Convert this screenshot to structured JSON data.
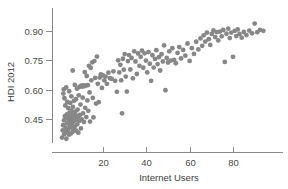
{
  "chart_data": {
    "type": "scatter",
    "title": "",
    "subtitle": "",
    "xlabel": "Internet Users",
    "ylabel": "HDI 2012",
    "xlim": [
      -2,
      100
    ],
    "ylim": [
      0.33,
      0.97
    ],
    "grid": false,
    "legend": null,
    "legend_position": "none",
    "marker": {
      "shape": "circle",
      "color": "#878787",
      "radius_px": 2.4,
      "opacity": 1
    },
    "axis": {
      "line_color": "#8a8a8a",
      "tick_color": "#8a8a8a",
      "label_color": "#4a4a4a"
    },
    "xticks": [
      20,
      40,
      60,
      80
    ],
    "xtick_labels": [
      "20",
      "40",
      "60",
      "80"
    ],
    "yticks": [
      0.45,
      0.6,
      0.75,
      0.9
    ],
    "ytick_labels": [
      "0.45",
      "0.60",
      "0.75",
      "0.90"
    ],
    "n_points": 188,
    "series": [
      {
        "name": "countries",
        "points": [
          [
            1.1,
            0.355
          ],
          [
            1.4,
            0.392
          ],
          [
            1.6,
            0.418
          ],
          [
            1.7,
            0.58
          ],
          [
            1.9,
            0.601
          ],
          [
            2.0,
            0.443
          ],
          [
            2.1,
            0.372
          ],
          [
            2.2,
            0.556
          ],
          [
            2.4,
            0.465
          ],
          [
            2.5,
            0.386
          ],
          [
            2.6,
            0.519
          ],
          [
            2.8,
            0.404
          ],
          [
            2.9,
            0.455
          ],
          [
            3.0,
            0.611
          ],
          [
            3.1,
            0.349
          ],
          [
            3.3,
            0.474
          ],
          [
            3.4,
            0.428
          ],
          [
            3.5,
            0.537
          ],
          [
            3.6,
            0.383
          ],
          [
            3.8,
            0.462
          ],
          [
            3.9,
            0.398
          ],
          [
            4.0,
            0.505
          ],
          [
            4.1,
            0.447
          ],
          [
            4.3,
            0.37
          ],
          [
            4.4,
            0.592
          ],
          [
            4.5,
            0.481
          ],
          [
            4.6,
            0.419
          ],
          [
            4.8,
            0.44
          ],
          [
            4.9,
            0.532
          ],
          [
            5.0,
            0.375
          ],
          [
            5.1,
            0.468
          ],
          [
            5.3,
            0.407
          ],
          [
            5.4,
            0.566
          ],
          [
            5.5,
            0.49
          ],
          [
            5.6,
            0.426
          ],
          [
            5.8,
            0.452
          ],
          [
            5.9,
            0.383
          ],
          [
            6.0,
            0.698
          ],
          [
            6.1,
            0.512
          ],
          [
            6.2,
            0.435
          ],
          [
            6.4,
            0.475
          ],
          [
            6.5,
            0.397
          ],
          [
            6.6,
            0.543
          ],
          [
            6.8,
            0.458
          ],
          [
            6.9,
            0.411
          ],
          [
            7.0,
            0.624
          ],
          [
            7.2,
            0.487
          ],
          [
            7.4,
            0.444
          ],
          [
            7.5,
            0.551
          ],
          [
            7.6,
            0.39
          ],
          [
            7.8,
            0.466
          ],
          [
            8.0,
            0.605
          ],
          [
            8.1,
            0.423
          ],
          [
            8.3,
            0.498
          ],
          [
            8.5,
            0.457
          ],
          [
            8.6,
            0.38
          ],
          [
            8.8,
            0.571
          ],
          [
            9.0,
            0.613
          ],
          [
            9.1,
            0.44
          ],
          [
            9.3,
            0.471
          ],
          [
            9.5,
            0.617
          ],
          [
            9.6,
            0.524
          ],
          [
            9.8,
            0.402
          ],
          [
            10.0,
            0.62
          ],
          [
            10.2,
            0.448
          ],
          [
            10.4,
            0.616
          ],
          [
            10.6,
            0.559
          ],
          [
            10.8,
            0.479
          ],
          [
            11.0,
            0.622
          ],
          [
            11.2,
            0.435
          ],
          [
            11.4,
            0.618
          ],
          [
            11.6,
            0.69
          ],
          [
            11.8,
            0.507
          ],
          [
            12.0,
            0.621
          ],
          [
            12.3,
            0.46
          ],
          [
            12.5,
            0.67
          ],
          [
            12.8,
            0.545
          ],
          [
            13.0,
            0.623
          ],
          [
            13.2,
            0.492
          ],
          [
            13.5,
            0.722
          ],
          [
            13.8,
            0.586
          ],
          [
            14.0,
            0.437
          ],
          [
            14.3,
            0.712
          ],
          [
            14.6,
            0.648
          ],
          [
            15.0,
            0.74
          ],
          [
            15.3,
            0.558
          ],
          [
            15.6,
            0.458
          ],
          [
            16.0,
            0.746
          ],
          [
            16.4,
            0.66
          ],
          [
            16.8,
            0.529
          ],
          [
            17.2,
            0.769
          ],
          [
            17.6,
            0.63
          ],
          [
            18.0,
            0.536
          ],
          [
            18.5,
            0.662
          ],
          [
            19.0,
            0.678
          ],
          [
            19.5,
            0.609
          ],
          [
            20.0,
            0.673
          ],
          [
            20.6,
            0.648
          ],
          [
            21.2,
            0.667
          ],
          [
            21.8,
            0.63
          ],
          [
            22.5,
            0.687
          ],
          [
            23.2,
            0.659
          ],
          [
            24.0,
            0.655
          ],
          [
            24.8,
            0.694
          ],
          [
            25.6,
            0.645
          ],
          [
            26.4,
            0.589
          ],
          [
            27.0,
            0.75
          ],
          [
            27.5,
            0.688
          ],
          [
            28.0,
            0.727
          ],
          [
            28.4,
            0.648
          ],
          [
            28.8,
            0.479
          ],
          [
            29.2,
            0.758
          ],
          [
            29.6,
            0.702
          ],
          [
            30.0,
            0.782
          ],
          [
            30.5,
            0.667
          ],
          [
            31.0,
            0.59
          ],
          [
            31.5,
            0.746
          ],
          [
            32.0,
            0.777
          ],
          [
            32.6,
            0.703
          ],
          [
            33.2,
            0.762
          ],
          [
            33.8,
            0.658
          ],
          [
            34.4,
            0.796
          ],
          [
            35.0,
            0.744
          ],
          [
            35.6,
            0.68
          ],
          [
            36.2,
            0.785
          ],
          [
            36.8,
            0.722
          ],
          [
            37.4,
            0.768
          ],
          [
            38.0,
            0.8
          ],
          [
            38.6,
            0.712
          ],
          [
            39.2,
            0.786
          ],
          [
            39.8,
            0.749
          ],
          [
            40.4,
            0.688
          ],
          [
            41.0,
            0.792
          ],
          [
            41.6,
            0.733
          ],
          [
            42.2,
            0.645
          ],
          [
            42.8,
            0.776
          ],
          [
            43.4,
            0.713
          ],
          [
            44.0,
            0.757
          ],
          [
            44.6,
            0.802
          ],
          [
            45.2,
            0.731
          ],
          [
            45.8,
            0.766
          ],
          [
            46.4,
            0.698
          ],
          [
            47.0,
            0.781
          ],
          [
            47.6,
            0.744
          ],
          [
            48.2,
            0.826
          ],
          [
            48.8,
            0.597
          ],
          [
            49.4,
            0.762
          ],
          [
            50.0,
            0.739
          ],
          [
            50.6,
            0.796
          ],
          [
            51.2,
            0.748
          ],
          [
            52.0,
            0.812
          ],
          [
            52.8,
            0.752
          ],
          [
            53.6,
            0.735
          ],
          [
            54.4,
            0.788
          ],
          [
            55.2,
            0.818
          ],
          [
            56.0,
            0.76
          ],
          [
            57.0,
            0.803
          ],
          [
            58.0,
            0.774
          ],
          [
            59.0,
            0.836
          ],
          [
            60.0,
            0.747
          ],
          [
            61.0,
            0.812
          ],
          [
            62.0,
            0.783
          ],
          [
            63.0,
            0.845
          ],
          [
            64.0,
            0.806
          ],
          [
            65.0,
            0.862
          ],
          [
            65.8,
            0.824
          ],
          [
            66.5,
            0.878
          ],
          [
            67.2,
            0.846
          ],
          [
            68.0,
            0.892
          ],
          [
            68.8,
            0.858
          ],
          [
            69.5,
            0.829
          ],
          [
            70.2,
            0.885
          ],
          [
            71.0,
            0.903
          ],
          [
            71.8,
            0.869
          ],
          [
            72.5,
            0.894
          ],
          [
            73.2,
            0.852
          ],
          [
            74.0,
            0.897
          ],
          [
            74.8,
            0.873
          ],
          [
            75.5,
            0.905
          ],
          [
            76.2,
            0.742
          ],
          [
            77.0,
            0.886
          ],
          [
            77.8,
            0.912
          ],
          [
            78.5,
            0.864
          ],
          [
            79.2,
            0.892
          ],
          [
            80.0,
            0.768
          ],
          [
            80.8,
            0.901
          ],
          [
            81.5,
            0.874
          ],
          [
            82.2,
            0.908
          ],
          [
            83.0,
            0.885
          ],
          [
            84.0,
            0.866
          ],
          [
            85.0,
            0.895
          ],
          [
            86.2,
            0.879
          ],
          [
            87.5,
            0.902
          ],
          [
            88.8,
            0.888
          ],
          [
            90.0,
            0.938
          ],
          [
            91.2,
            0.894
          ],
          [
            92.5,
            0.906
          ],
          [
            94.0,
            0.901
          ]
        ]
      }
    ]
  }
}
